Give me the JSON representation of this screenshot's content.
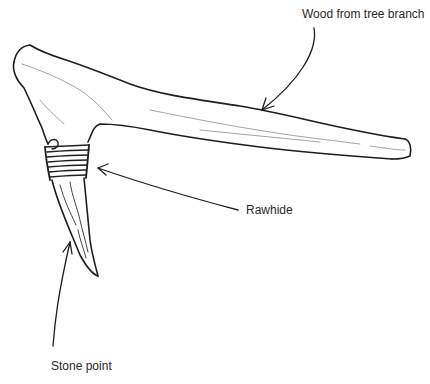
{
  "diagram": {
    "labels": {
      "wood": "Wood from tree branch",
      "rawhide": "Rawhide",
      "stone": "Stone point"
    },
    "colors": {
      "ink": "#1e1e1e",
      "light_ink": "#9a9a9a",
      "background": "#ffffff"
    }
  }
}
